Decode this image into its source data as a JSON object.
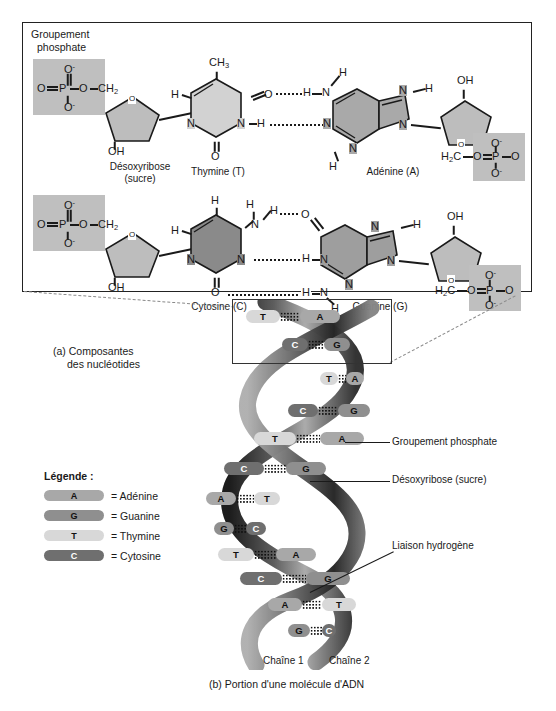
{
  "figure": {
    "panel_a": {
      "phosphate_label": {
        "line1": "Groupement",
        "line2": "phosphate"
      },
      "deoxyribose_label": {
        "line1": "Désoxyribose",
        "line2": "(sucre)"
      },
      "caption": {
        "line1": "(a) Composantes",
        "line2": "des nucléotides"
      },
      "bases": {
        "thymine": "Thymine (T)",
        "adenine": "Adénine (A)",
        "cytosine": "Cytosine (C)",
        "guanine": "Guanine (G)"
      },
      "atoms": {
        "O": "O",
        "N": "N",
        "H": "H",
        "P": "P",
        "C": "C",
        "CH3": "CH3",
        "CH2": "CH2",
        "H2C": "H2C",
        "OH": "OH",
        "O_minus": "O-",
        "double_bond_O": "O="
      }
    },
    "panel_b": {
      "caption": "(b) Portion d'une molécule d'ADN",
      "chain1": "Chaîne 1",
      "chain2": "Chaîne 2",
      "callouts": [
        "Groupement phosphate",
        "Désoxyribose (sucre)",
        "Liaison hydrogène"
      ],
      "base_pairs": [
        {
          "left": "T",
          "right": "A"
        },
        {
          "left": "C",
          "right": "G"
        },
        {
          "left": "T",
          "right": "A"
        },
        {
          "left": "C",
          "right": "G"
        },
        {
          "left": "T",
          "right": "A"
        },
        {
          "left": "C",
          "right": "G"
        },
        {
          "left": "A",
          "right": "T"
        },
        {
          "left": "G",
          "right": "C"
        },
        {
          "left": "T",
          "right": "A"
        },
        {
          "left": "C",
          "right": "G"
        },
        {
          "left": "A",
          "right": "T"
        },
        {
          "left": "G",
          "right": "C"
        }
      ]
    },
    "legend": {
      "title": "Légende :",
      "items": [
        {
          "code": "A",
          "label": "= Adénine",
          "color": "#a8a8a8"
        },
        {
          "code": "G",
          "label": "= Guanine",
          "color": "#8f8f8f"
        },
        {
          "code": "T",
          "label": "= Thymine",
          "color": "#d8d8d8"
        },
        {
          "code": "C",
          "label": "= Cytosine",
          "color": "#6f6f6f"
        }
      ]
    },
    "colors": {
      "phosphate_box": "#bfbfbf",
      "sugar_fill": "#bdbdbd",
      "thymine_fill": "#d2d2d2",
      "adenine_fill": "#a9a9a9",
      "cytosine_fill": "#8a8a8a",
      "guanine_fill": "#9e9e9e",
      "border": "#222222"
    }
  }
}
